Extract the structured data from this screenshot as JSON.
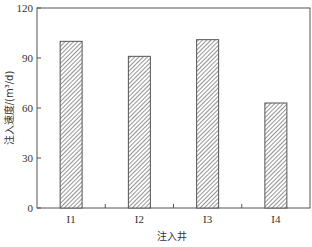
{
  "chart_data": {
    "type": "bar",
    "title": "",
    "xlabel": "注入井",
    "ylabel": "注入速度/(m³/d)",
    "categories": [
      "I1",
      "I2",
      "I3",
      "I4"
    ],
    "values": [
      100,
      91,
      101,
      63
    ],
    "ylim": [
      0,
      120
    ],
    "yticks": [
      0,
      30,
      60,
      90,
      120
    ],
    "grid": false,
    "legend": null,
    "bar_style": "diagonal-hatch",
    "colors": {
      "axis": "#555555",
      "bar_edge": "#555555",
      "hatch": "#666666",
      "background": "#ffffff"
    }
  }
}
